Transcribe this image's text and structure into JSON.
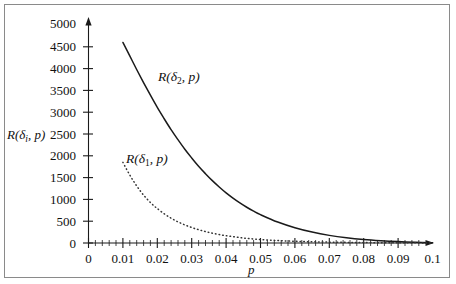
{
  "figure": {
    "background_color": "#ffffff",
    "frame_color": "#8a8a8a",
    "curve_color": "#1a1a1a"
  },
  "axes": {
    "y_label_prefix": "R(",
    "y_label_delta": "δ",
    "y_label_sub": "i",
    "y_label_suffix": ", p)",
    "x_label": "p",
    "y_ticks": [
      "0",
      "500",
      "1000",
      "1500",
      "2000",
      "2500",
      "3000",
      "3500",
      "4000",
      "4500",
      "5000"
    ],
    "x_ticks": [
      "0",
      "0.01",
      "0.02",
      "0.03",
      "0.04",
      "0.05",
      "0.06",
      "0.07",
      "0.08",
      "0.09",
      "0.1"
    ]
  },
  "curve_labels": {
    "delta2": {
      "prefix": "R(",
      "delta": "δ",
      "sub": "2",
      "suffix": ", p)"
    },
    "delta1": {
      "prefix": "R(",
      "delta": "δ",
      "sub": "1",
      "suffix": ", p)"
    }
  },
  "chart_data": {
    "type": "line",
    "title": "",
    "xlabel": "p",
    "ylabel": "R(δi, p)",
    "xlim": [
      0,
      0.1
    ],
    "ylim": [
      0,
      5000
    ],
    "xticks": [
      0,
      0.01,
      0.02,
      0.03,
      0.04,
      0.05,
      0.06,
      0.07,
      0.08,
      0.09,
      0.1
    ],
    "yticks": [
      0,
      500,
      1000,
      1500,
      2000,
      2500,
      3000,
      3500,
      4000,
      4500,
      5000
    ],
    "grid": false,
    "legend": "inline-annotations",
    "series": [
      {
        "name": "R(δ2, p)",
        "style": "solid",
        "label_position": {
          "x": 0.0225,
          "y": 3800
        },
        "x": [
          0.01,
          0.012,
          0.014,
          0.016,
          0.018,
          0.02,
          0.022,
          0.024,
          0.026,
          0.028,
          0.03,
          0.032,
          0.034,
          0.036,
          0.038,
          0.04,
          0.042,
          0.044,
          0.046,
          0.048,
          0.05,
          0.055,
          0.06,
          0.065,
          0.07,
          0.075,
          0.08,
          0.085,
          0.09,
          0.095,
          0.1
        ],
        "y": [
          4600,
          4290,
          3980,
          3680,
          3390,
          3110,
          2850,
          2600,
          2370,
          2150,
          1950,
          1760,
          1590,
          1430,
          1285,
          1150,
          1030,
          920,
          820,
          730,
          650,
          480,
          350,
          250,
          175,
          120,
          80,
          52,
          32,
          18,
          8
        ]
      },
      {
        "name": "R(δ1, p)",
        "style": "dotted",
        "label_position": {
          "x": 0.0135,
          "y": 1950
        },
        "x": [
          0.01,
          0.011,
          0.012,
          0.013,
          0.014,
          0.015,
          0.016,
          0.017,
          0.018,
          0.019,
          0.02,
          0.022,
          0.024,
          0.026,
          0.028,
          0.03,
          0.032,
          0.034,
          0.036,
          0.038,
          0.04,
          0.045,
          0.05,
          0.055,
          0.06,
          0.065,
          0.07,
          0.075,
          0.08,
          0.09,
          0.1
        ],
        "y": [
          1850,
          1700,
          1560,
          1430,
          1310,
          1200,
          1100,
          1010,
          930,
          855,
          790,
          670,
          570,
          485,
          415,
          355,
          305,
          262,
          225,
          194,
          167,
          115,
          80,
          56,
          39,
          28,
          20,
          14,
          10,
          5,
          2
        ]
      }
    ]
  }
}
